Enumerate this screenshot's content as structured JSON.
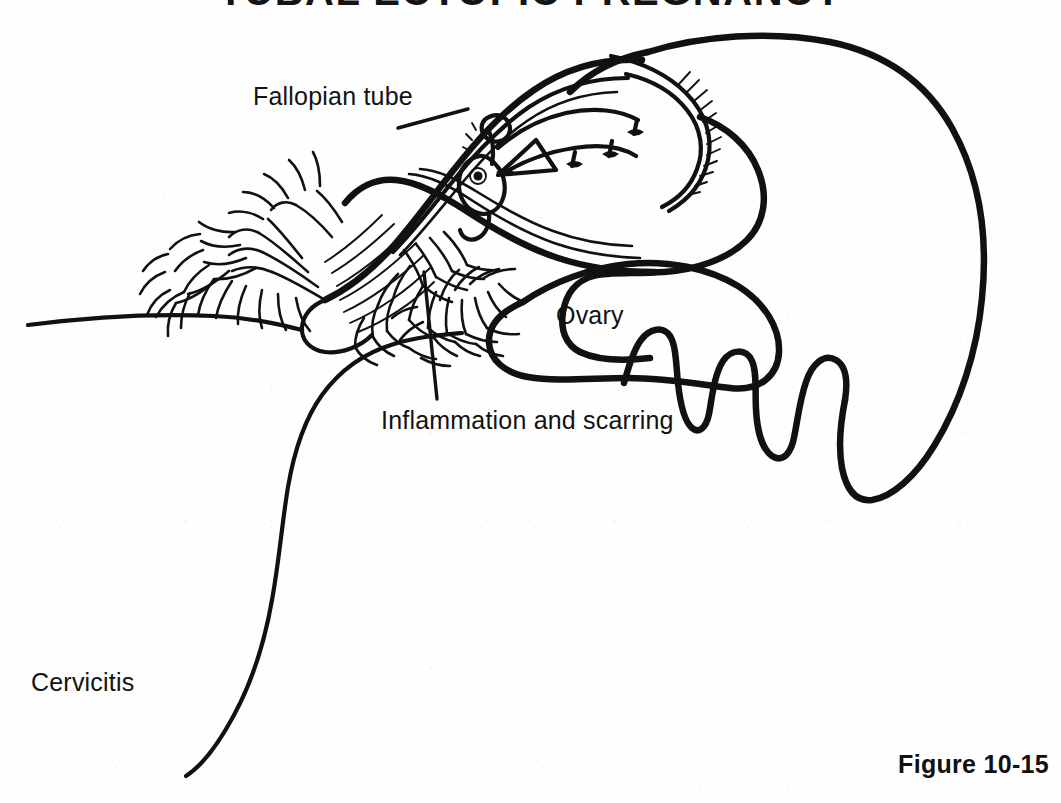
{
  "figure": {
    "title": "TUBAL ECTOPIC PREGNANCY",
    "caption": "Figure 10-15",
    "background_color": "#fefefe",
    "ink_color": "#111111"
  },
  "labels": {
    "fallopian_tube": "Fallopian tube",
    "ovary": "Ovary",
    "inflammation": "Inflammation and scarring",
    "cervicitis": "Cervicitis"
  },
  "annotations": [
    {
      "id": "fallopian-tube",
      "text": "Fallopian tube",
      "x": 253,
      "y": 82,
      "leader": {
        "from": [
          398,
          128
        ],
        "to": [
          468,
          109
        ]
      }
    },
    {
      "id": "ovary",
      "text": "Ovary",
      "x": 556,
      "y": 301,
      "leader": null
    },
    {
      "id": "inflammation",
      "text": "Inflammation and scarring",
      "x": 381,
      "y": 406,
      "leader": {
        "from": [
          437,
          399
        ],
        "to": [
          424,
          272
        ]
      }
    },
    {
      "id": "cervicitis",
      "text": "Cervicitis",
      "x": 31,
      "y": 668,
      "leader": null
    }
  ],
  "structures": [
    {
      "name": "uterus-body",
      "description": "large rounded uterine corpus occupying the right of the field with lobed, folded lower margin"
    },
    {
      "name": "uterine-cavity",
      "description": "hatched endometrial lining curving along the upper-left of the uterine corpus"
    },
    {
      "name": "fallopian-tube",
      "description": "dilated tube running from upper right down to the lower left, swollen around the gestation"
    },
    {
      "name": "ectopic-embryo",
      "description": "embryo with amniotic sac and chorionic villi implanted inside the tubal lumen"
    },
    {
      "name": "fimbriae",
      "description": "frond-like fimbriated end of the tube at the far left, matted with adhesions"
    },
    {
      "name": "inflammation-scarring",
      "description": "dense tangled adhesion strands clustered beneath and around the tube"
    },
    {
      "name": "ovary",
      "description": "ovoid ovary lying below and to the right of the tube"
    },
    {
      "name": "broad-ligament",
      "description": "long horizontal line running to the left page margin"
    },
    {
      "name": "cervix-vaginal-wall",
      "description": "long sinuous line descending from the lower uterus toward the bottom-left corner"
    }
  ]
}
